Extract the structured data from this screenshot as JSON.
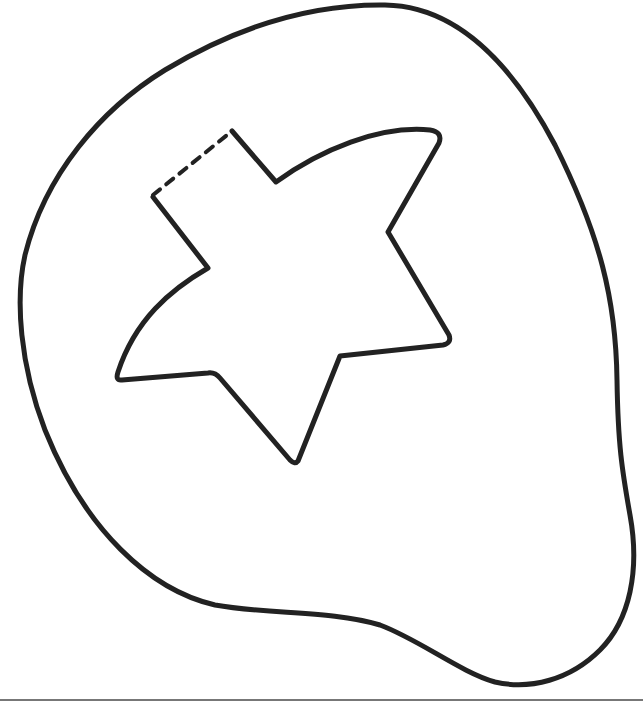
{
  "drawing": {
    "subject": "star cutout inside blob outline",
    "colors": {
      "background": "#ffffff",
      "stroke": "#222222",
      "baseline": "#777777"
    },
    "outer_shape": "blob-outline",
    "inner_shape": "five-point-star-outline",
    "dashed_edge": "star top-left edge (cut/fold line)",
    "baseline": "horizontal rule at bottom"
  }
}
